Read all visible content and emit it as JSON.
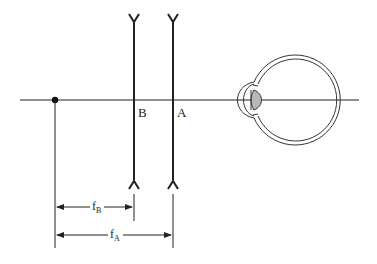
{
  "diagram": {
    "title": "",
    "lens_labels": {
      "B": "B",
      "A": "A"
    },
    "focal_labels": {
      "fB": {
        "main": "f",
        "sub": "B"
      },
      "fA": {
        "main": "f",
        "sub": "A"
      }
    },
    "components": [
      "optical-axis",
      "focal-point",
      "lens-B (diverging)",
      "lens-A (diverging)",
      "eye"
    ],
    "colors": {
      "line": "#222222",
      "lens_fill": "#b8b8b8",
      "background": "#ffffff"
    }
  }
}
